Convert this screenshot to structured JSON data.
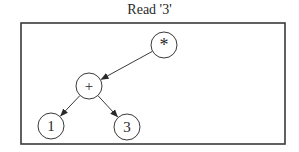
{
  "title": "Read '3'",
  "diagram": {
    "type": "expression-tree",
    "frame": {
      "x": 21,
      "y": 23,
      "width": 264,
      "height": 121
    },
    "nodes": [
      {
        "id": "mul",
        "label": "*",
        "x": 164,
        "y": 45,
        "r": 13
      },
      {
        "id": "add",
        "label": "+",
        "x": 89,
        "y": 86,
        "r": 13
      },
      {
        "id": "one",
        "label": "1",
        "x": 51,
        "y": 126,
        "r": 13
      },
      {
        "id": "three",
        "label": "3",
        "x": 127,
        "y": 127,
        "r": 13
      }
    ],
    "edges": [
      {
        "from": "mul",
        "to": "add"
      },
      {
        "from": "add",
        "to": "one"
      },
      {
        "from": "add",
        "to": "three"
      }
    ],
    "colors": {
      "stroke": "#3a3a3a",
      "text": "#2a2a2a"
    }
  }
}
